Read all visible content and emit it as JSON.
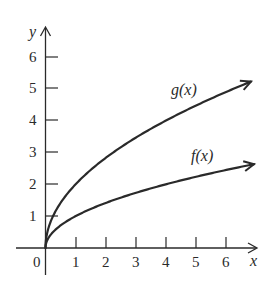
{
  "chart_data": {
    "type": "line",
    "title": "",
    "xlabel": "x",
    "ylabel": "y",
    "xlim": [
      0,
      7
    ],
    "ylim": [
      0,
      6.6
    ],
    "grid": false,
    "legend": "inline labels near curves",
    "x_ticks": [
      "0",
      "1",
      "2",
      "3",
      "4",
      "5",
      "6"
    ],
    "y_ticks": [
      "1",
      "2",
      "3",
      "4",
      "5",
      "6"
    ],
    "series": [
      {
        "name": "g(x)",
        "formula": "2*sqrt(x)",
        "x": [
          0,
          0.25,
          0.5,
          1,
          2,
          3,
          4,
          5,
          6,
          6.9
        ],
        "values": [
          0,
          1.0,
          1.41,
          2.0,
          2.83,
          3.46,
          4.0,
          4.47,
          4.9,
          5.25
        ]
      },
      {
        "name": "f(x)",
        "formula": "sqrt(x)",
        "x": [
          0,
          0.25,
          0.5,
          1,
          2,
          3,
          4,
          5,
          6,
          6.9
        ],
        "values": [
          0,
          0.5,
          0.71,
          1.0,
          1.41,
          1.73,
          2.0,
          2.24,
          2.45,
          2.63
        ]
      }
    ],
    "annotations": [
      "g(x)",
      "f(x)"
    ]
  },
  "labels": {
    "origin": "0",
    "x_axis": "x",
    "y_axis": "y",
    "g": "g(x)",
    "f": "f(x)",
    "xt": [
      "1",
      "2",
      "3",
      "4",
      "5",
      "6"
    ],
    "yt": [
      "1",
      "2",
      "3",
      "4",
      "5",
      "6"
    ]
  },
  "colors": {
    "ink": "#2a2a2a"
  }
}
